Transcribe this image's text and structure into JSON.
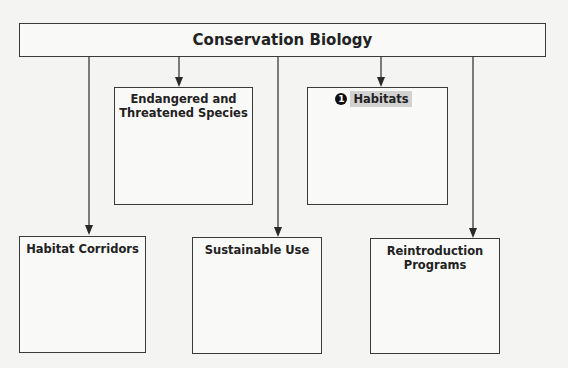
{
  "diagram": {
    "root": {
      "label": "Conservation Biology"
    },
    "children": [
      {
        "id": "endangered",
        "label_line1": "Endangered and",
        "label_line2": "Threatened Species"
      },
      {
        "id": "habitats",
        "label": "Habitats",
        "badge": "1",
        "highlighted": true
      },
      {
        "id": "corridors",
        "label": "Habitat Corridors"
      },
      {
        "id": "sustainable",
        "label": "Sustainable Use"
      },
      {
        "id": "reintroduction",
        "label_line1": "Reintroduction",
        "label_line2": "Programs"
      }
    ],
    "colors": {
      "line": "#3a3a3a",
      "background": "#f4f4f3",
      "highlight": "#d2d2d2",
      "badge": "#111111"
    }
  }
}
